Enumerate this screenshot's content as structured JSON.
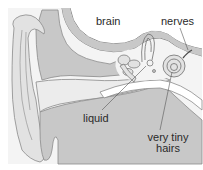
{
  "diagram": {
    "labels": {
      "brain": "brain",
      "nerves": "nerves",
      "liquid": "liquid",
      "hairs_line1": "very tiny",
      "hairs_line2": "hairs"
    },
    "colors": {
      "background": "#ffffff",
      "panel": "#f2f2f2",
      "light_tissue": "#e6e6e6",
      "mid_tissue": "#c8c8c8",
      "canal": "#ececec",
      "outline": "#8a8a8a",
      "text": "#2a2a2a"
    }
  }
}
